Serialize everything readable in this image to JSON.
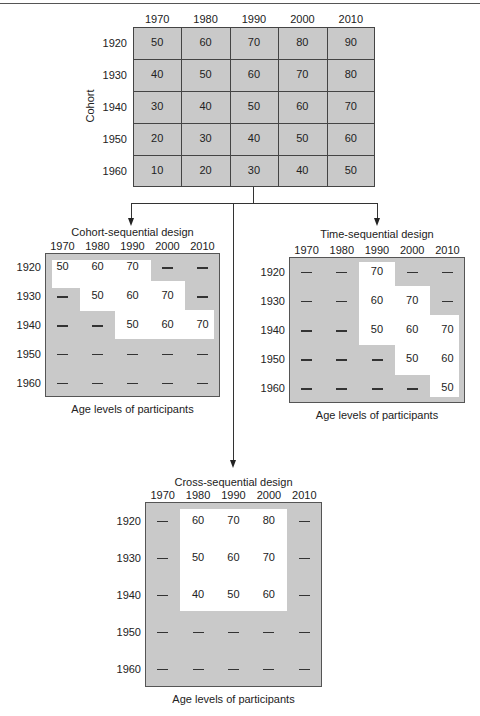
{
  "years": [
    "1970",
    "1980",
    "1990",
    "2000",
    "2010"
  ],
  "cohorts": [
    "1920",
    "1930",
    "1940",
    "1950",
    "1960"
  ],
  "main": {
    "axis_label": "Cohort",
    "values": [
      [
        "50",
        "60",
        "70",
        "80",
        "90"
      ],
      [
        "40",
        "50",
        "60",
        "70",
        "80"
      ],
      [
        "30",
        "40",
        "50",
        "60",
        "70"
      ],
      [
        "20",
        "30",
        "40",
        "50",
        "60"
      ],
      [
        "10",
        "20",
        "30",
        "40",
        "50"
      ]
    ]
  },
  "cohort_sequential": {
    "title": "Cohort-sequential design",
    "footer": "Age levels of participants",
    "values": [
      [
        "50",
        "60",
        "70",
        "—",
        "—"
      ],
      [
        "—",
        "50",
        "60",
        "70",
        "—"
      ],
      [
        "—",
        "—",
        "50",
        "60",
        "70"
      ],
      [
        "—",
        "—",
        "—",
        "—",
        "—"
      ],
      [
        "—",
        "—",
        "—",
        "—",
        "—"
      ]
    ]
  },
  "time_sequential": {
    "title": "Time-sequential design",
    "footer": "Age levels of participants",
    "values": [
      [
        "—",
        "—",
        "70",
        "—",
        "—"
      ],
      [
        "—",
        "—",
        "60",
        "70",
        "—"
      ],
      [
        "—",
        "—",
        "50",
        "60",
        "70"
      ],
      [
        "—",
        "—",
        "—",
        "50",
        "60"
      ],
      [
        "—",
        "—",
        "—",
        "—",
        "50"
      ]
    ]
  },
  "cross_sequential": {
    "title": "Cross-sequential design",
    "footer": "Age levels of participants",
    "values": [
      [
        "—",
        "60",
        "70",
        "80",
        "—"
      ],
      [
        "—",
        "50",
        "60",
        "70",
        "—"
      ],
      [
        "—",
        "40",
        "50",
        "60",
        "—"
      ],
      [
        "—",
        "—",
        "—",
        "—",
        "—"
      ],
      [
        "—",
        "—",
        "—",
        "—",
        "—"
      ]
    ]
  },
  "chart_data": {
    "type": "table",
    "columns": [
      "1970",
      "1980",
      "1990",
      "2000",
      "2010"
    ],
    "rows": [
      "1920",
      "1930",
      "1940",
      "1950",
      "1960"
    ],
    "row_axis_label": "Cohort",
    "tables": [
      {
        "name": "Full matrix (ages)",
        "values": [
          [
            50,
            60,
            70,
            80,
            90
          ],
          [
            40,
            50,
            60,
            70,
            80
          ],
          [
            30,
            40,
            50,
            60,
            70
          ],
          [
            20,
            30,
            40,
            50,
            60
          ],
          [
            10,
            20,
            30,
            40,
            50
          ]
        ]
      },
      {
        "name": "Cohort-sequential design",
        "values": [
          [
            50,
            60,
            70,
            null,
            null
          ],
          [
            null,
            50,
            60,
            70,
            null
          ],
          [
            null,
            null,
            50,
            60,
            70
          ],
          [
            null,
            null,
            null,
            null,
            null
          ],
          [
            null,
            null,
            null,
            null,
            null
          ]
        ]
      },
      {
        "name": "Time-sequential design",
        "values": [
          [
            null,
            null,
            70,
            null,
            null
          ],
          [
            null,
            null,
            60,
            70,
            null
          ],
          [
            null,
            null,
            50,
            60,
            70
          ],
          [
            null,
            null,
            null,
            50,
            60
          ],
          [
            null,
            null,
            null,
            null,
            50
          ]
        ]
      },
      {
        "name": "Cross-sequential design",
        "values": [
          [
            null,
            60,
            70,
            80,
            null
          ],
          [
            null,
            50,
            60,
            70,
            null
          ],
          [
            null,
            40,
            50,
            60,
            null
          ],
          [
            null,
            null,
            null,
            null,
            null
          ],
          [
            null,
            null,
            null,
            null,
            null
          ]
        ]
      }
    ],
    "footer_label": "Age levels of participants"
  }
}
